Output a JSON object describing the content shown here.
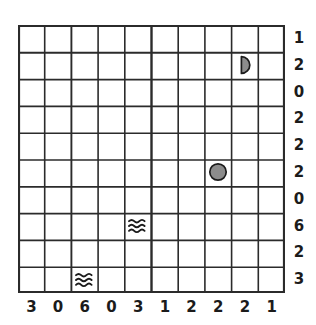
{
  "puzzle": {
    "title": "battleship-style grid puzzle",
    "grid": {
      "columns": 10,
      "rows": 10,
      "line_color": "#2b2b2b",
      "background": "#ffffff"
    },
    "row_clues": [
      "1",
      "2",
      "0",
      "2",
      "2",
      "2",
      "0",
      "6",
      "2",
      "3"
    ],
    "column_clues": [
      "3",
      "0",
      "6",
      "0",
      "3",
      "1",
      "2",
      "2",
      "2",
      "1"
    ],
    "symbols": [
      {
        "name": "half-circle-icon",
        "kind": "half-circle",
        "label": "ship-end",
        "row": 2,
        "col": 9,
        "fill": "#8c8c8c",
        "stroke": "#1b1b1b"
      },
      {
        "name": "filled-circle-icon",
        "kind": "circle",
        "label": "submarine",
        "row": 6,
        "col": 8,
        "fill": "#8c8c8c",
        "stroke": "#1b1b1b"
      },
      {
        "name": "water-waves-icon",
        "kind": "waves",
        "label": "water",
        "row": 8,
        "col": 5,
        "fill": "none",
        "stroke": "#1b1b1b"
      },
      {
        "name": "water-waves-icon",
        "kind": "waves",
        "label": "water",
        "row": 10,
        "col": 3,
        "fill": "none",
        "stroke": "#1b1b1b"
      }
    ]
  }
}
